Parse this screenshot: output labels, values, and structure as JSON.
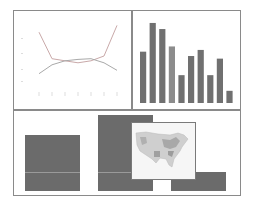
{
  "layout": {
    "panels": [
      "line-chart",
      "bar-chart",
      "block-composition-with-map"
    ]
  },
  "colors": {
    "border": "#8a8a8a",
    "line_series_a": "#c9a9a9",
    "line_series_b": "#a9a9a9",
    "bar_fill": "#707070",
    "bar_fill_light": "#8c8c8c",
    "block_fill": "#6b6b6b",
    "map_bg": "#f6f6f6",
    "map_land": "#cfcfcf"
  },
  "chart_data": [
    {
      "type": "line",
      "title": "",
      "xlabel": "",
      "ylabel": "",
      "x": [
        1,
        2,
        3,
        4,
        5,
        6,
        7
      ],
      "series": [
        {
          "name": "series-a",
          "values": [
            8.5,
            4.6,
            4.3,
            4.0,
            4.3,
            5.0,
            9.5
          ]
        },
        {
          "name": "series-b",
          "values": [
            2.4,
            3.7,
            4.3,
            4.5,
            4.6,
            4.0,
            2.9
          ]
        }
      ],
      "ylim": [
        0,
        10
      ],
      "grid": false,
      "legend": "none",
      "note": "tick labels present but illegible"
    },
    {
      "type": "bar",
      "title": "",
      "xlabel": "",
      "ylabel": "",
      "categories": [
        "1",
        "2",
        "3",
        "4",
        "5",
        "6",
        "7",
        "8",
        "9",
        "10"
      ],
      "values": [
        59,
        92,
        85,
        65,
        32,
        54,
        61,
        32,
        51,
        14
      ],
      "ylim": [
        0,
        100
      ],
      "grid": false,
      "legend": "none"
    },
    {
      "type": "bar",
      "title": "",
      "categories": [
        "A",
        "B",
        "C"
      ],
      "values": [
        56,
        76,
        19
      ],
      "ylim": [
        0,
        80
      ],
      "note": "blocky bars with a US choropleth map inset overlaid"
    }
  ]
}
